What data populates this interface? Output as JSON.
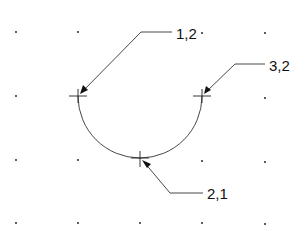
{
  "diagram": {
    "type": "arc-point-labels",
    "grid": {
      "xs": [
        16,
        78,
        140,
        202,
        265
      ],
      "ys": [
        32,
        96,
        160,
        223
      ]
    },
    "arc": {
      "cx": 140,
      "cy": 96,
      "r": 62,
      "description": "lower semicircle through points 1,2 / 2,1 / 3,2"
    },
    "points": [
      {
        "label": "1,2",
        "x": 78,
        "y": 96
      },
      {
        "label": "2,1",
        "x": 140,
        "y": 158
      },
      {
        "label": "3,2",
        "x": 202,
        "y": 96
      }
    ],
    "callouts": [
      {
        "label": "1,2",
        "text_x": 176,
        "text_y": 26
      },
      {
        "label": "3,2",
        "text_x": 269,
        "text_y": 58
      },
      {
        "label": "2,1",
        "text_x": 207,
        "text_y": 184
      }
    ]
  }
}
